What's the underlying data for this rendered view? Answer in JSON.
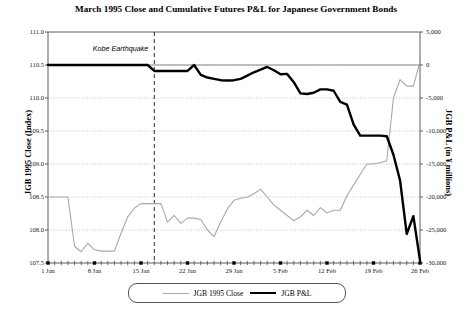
{
  "chart_data": {
    "type": "line",
    "title": "March 1995 Close and Cumulative Futures P&L for Japanese Government Bonds",
    "xlabel": "",
    "grid": true,
    "legend_position": "bottom",
    "x_tick_labels": [
      "1 Jan",
      "8 Jan",
      "15 Jan",
      "22 Jan",
      "29 Jan",
      "5 Feb",
      "12 Feb",
      "19 Feb",
      "26 Feb"
    ],
    "x_tick_indices": [
      0,
      7,
      14,
      21,
      28,
      35,
      42,
      49,
      56
    ],
    "x_count": 57,
    "axes": {
      "left": {
        "label": "JGB 1995 Close (Index)",
        "ticks": [
          "107.5",
          "108.0",
          "108.5",
          "109.0",
          "109.5",
          "110.0",
          "110.5",
          "111.0"
        ],
        "tick_values": [
          107.5,
          108.0,
          108.5,
          109.0,
          109.5,
          110.0,
          110.5,
          111.0
        ],
        "ylim": [
          107.5,
          111.0
        ]
      },
      "right": {
        "label": "JGB P&L (in ¥ millions)",
        "ticks": [
          "-30,000",
          "-25,000",
          "-20,000",
          "-15,000",
          "-10,000",
          "-5,000",
          "0",
          "5,000"
        ],
        "tick_values": [
          -30000,
          -25000,
          -20000,
          -15000,
          -10000,
          -5000,
          0,
          5000
        ],
        "ylim": [
          -30000,
          5000
        ]
      }
    },
    "annotations": [
      {
        "text": "Kobe Earthquake",
        "x_index": 16,
        "line": "dashed-vertical",
        "label_position": "left-of-line-top"
      }
    ],
    "series": [
      {
        "name": "JGB 1995 Close",
        "axis": "left",
        "color": "#a8a8a8",
        "width": 1.1,
        "values": [
          108.5,
          108.5,
          108.5,
          108.5,
          107.75,
          107.67,
          107.8,
          107.7,
          107.68,
          107.68,
          107.68,
          107.95,
          108.2,
          108.33,
          108.4,
          108.4,
          108.4,
          108.4,
          108.12,
          108.22,
          108.1,
          108.18,
          108.18,
          108.16,
          108.0,
          107.9,
          108.12,
          108.32,
          108.45,
          108.48,
          108.5,
          108.55,
          108.62,
          108.5,
          108.38,
          108.3,
          108.22,
          108.14,
          108.2,
          108.3,
          108.22,
          108.34,
          108.26,
          108.3,
          108.3,
          108.52,
          108.68,
          108.84,
          109.0,
          109.0,
          109.02,
          109.05,
          110.0,
          110.28,
          110.18,
          110.18,
          110.55
        ]
      },
      {
        "name": "JGB P&L",
        "axis": "right",
        "color": "#000000",
        "width": 2.4,
        "values": [
          0,
          0,
          0,
          0,
          0,
          0,
          0,
          0,
          0,
          0,
          0,
          0,
          0,
          0,
          0,
          0,
          -900,
          -900,
          -900,
          -900,
          -900,
          -900,
          0,
          -1500,
          -1900,
          -2100,
          -2300,
          -2350,
          -2300,
          -2100,
          -1600,
          -1100,
          -700,
          -300,
          -800,
          -1400,
          -1350,
          -2600,
          -4300,
          -4400,
          -4200,
          -3700,
          -3700,
          -3900,
          -5600,
          -6000,
          -9000,
          -10700,
          -10700,
          -10700,
          -10700,
          -10800,
          -13600,
          -17500,
          -25600,
          -22900,
          -29600
        ]
      }
    ]
  },
  "legend": {
    "items": [
      {
        "label": "JGB 1995 Close",
        "style": "close"
      },
      {
        "label": "JGB P&L",
        "style": "pl"
      }
    ]
  }
}
